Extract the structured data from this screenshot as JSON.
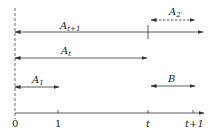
{
  "diagram": {
    "type": "timeline",
    "colors": {
      "line": "#333333",
      "text": "#222222",
      "background": "#ffffff"
    },
    "axis": {
      "ticks": [
        {
          "label": "0",
          "x": 15
        },
        {
          "label": "1",
          "x": 58
        },
        {
          "label": "t",
          "x": 148
        },
        {
          "label": "t+1",
          "x": 193
        }
      ]
    },
    "intervals": [
      {
        "id": "a_t_plus_1",
        "label_main": "A",
        "label_sub": "t+1",
        "from": "0",
        "to": "beyond t+1",
        "style": "solid"
      },
      {
        "id": "a_2",
        "label_main": "A",
        "label_sub": "2",
        "from": "t",
        "to": "t+1",
        "style": "dashed"
      },
      {
        "id": "a_t",
        "label_main": "A",
        "label_sub": "t",
        "from": "0",
        "to": "t",
        "style": "solid"
      },
      {
        "id": "a_1",
        "label_main": "A",
        "label_sub": "1",
        "from": "0",
        "to": "1",
        "style": "solid"
      },
      {
        "id": "b",
        "label_main": "B",
        "label_sub": "",
        "from": "t",
        "to": "t+1",
        "style": "solid"
      }
    ]
  }
}
